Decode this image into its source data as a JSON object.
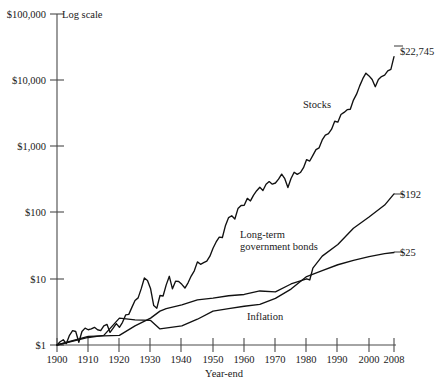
{
  "chart_data": {
    "type": "line",
    "title": "",
    "subtitle": "",
    "xlabel": "Year-end",
    "ylabel": "",
    "scale_note": "Log scale",
    "yscale": "log",
    "ylim": [
      1,
      100000
    ],
    "xlim": [
      1900,
      2008
    ],
    "grid": false,
    "legend_position": "inline-right",
    "ytick_labels": [
      "$100,000",
      "$10,000",
      "$1,000",
      "$100",
      "$10",
      "$1"
    ],
    "ytick_values": [
      100000,
      10000,
      1000,
      100,
      10,
      1
    ],
    "xtick_labels": [
      "1900",
      "1910",
      "1920",
      "1930",
      "1940",
      "1950",
      "1960",
      "1970",
      "1980",
      "1990",
      "2000",
      "2008"
    ],
    "xtick_values": [
      1900,
      1910,
      1920,
      1930,
      1940,
      1950,
      1960,
      1970,
      1980,
      1990,
      2000,
      2008
    ],
    "series": [
      {
        "name": "Stocks",
        "label": "Stocks",
        "end_label": "$22,745",
        "end_value": 22745,
        "color": "#111111",
        "x": [
          1900,
          1901,
          1902,
          1903,
          1904,
          1905,
          1906,
          1907,
          1908,
          1909,
          1910,
          1911,
          1912,
          1913,
          1914,
          1915,
          1916,
          1917,
          1918,
          1919,
          1920,
          1921,
          1922,
          1923,
          1924,
          1925,
          1926,
          1927,
          1928,
          1929,
          1930,
          1931,
          1932,
          1933,
          1934,
          1935,
          1936,
          1937,
          1938,
          1939,
          1940,
          1941,
          1942,
          1943,
          1944,
          1945,
          1946,
          1947,
          1948,
          1949,
          1950,
          1951,
          1952,
          1953,
          1954,
          1955,
          1956,
          1957,
          1958,
          1959,
          1960,
          1961,
          1962,
          1963,
          1964,
          1965,
          1966,
          1967,
          1968,
          1969,
          1970,
          1971,
          1972,
          1973,
          1974,
          1975,
          1976,
          1977,
          1978,
          1979,
          1980,
          1981,
          1982,
          1983,
          1984,
          1985,
          1986,
          1987,
          1988,
          1989,
          1990,
          1991,
          1992,
          1993,
          1994,
          1995,
          1996,
          1997,
          1998,
          1999,
          2000,
          2001,
          2002,
          2003,
          2004,
          2005,
          2006,
          2007,
          2008
        ],
        "values": [
          1.0,
          1.12,
          1.2,
          1.05,
          1.4,
          1.65,
          1.6,
          1.1,
          1.6,
          1.8,
          1.7,
          1.75,
          1.85,
          1.7,
          1.65,
          1.95,
          2.05,
          1.55,
          1.8,
          2.1,
          1.85,
          2.2,
          2.85,
          2.9,
          3.7,
          4.7,
          5.15,
          7.1,
          10.3,
          9.45,
          7.05,
          3.95,
          3.6,
          5.6,
          5.5,
          8.1,
          10.9,
          7.05,
          9.2,
          9.1,
          8.25,
          7.25,
          8.7,
          11.0,
          13.2,
          18.0,
          16.55,
          17.5,
          18.5,
          22.0,
          29.0,
          36.0,
          42.5,
          42.0,
          64.0,
          84.0,
          89.5,
          80.0,
          115.0,
          128.0,
          129.0,
          164.0,
          150.0,
          184.0,
          214.0,
          241.0,
          216.0,
          268.0,
          294.0,
          269.0,
          280.0,
          320.0,
          381.0,
          325.0,
          239.0,
          328.0,
          407.0,
          378.0,
          403.0,
          477.0,
          632.0,
          601.0,
          730.0,
          894.0,
          950.0,
          1252.0,
          1485.0,
          1563.0,
          1822.0,
          2399.0,
          2324.0,
          3031.0,
          3263.0,
          3591.0,
          3639.0,
          5006.0,
          6155.0,
          8208.0,
          10555.0,
          12773.0,
          11609.0,
          10228.0,
          7968.0,
          10252.0,
          11365.0,
          11924.0,
          13806.0,
          14562.0,
          22745.0
        ]
      },
      {
        "name": "Long-term government bonds",
        "label": "Long-term\ngovernment bonds",
        "end_label": "$192",
        "end_value": 192,
        "color": "#111111",
        "x": [
          1900,
          1910,
          1920,
          1925,
          1930,
          1933,
          1935,
          1940,
          1945,
          1950,
          1955,
          1960,
          1965,
          1970,
          1975,
          1980,
          1981,
          1982,
          1985,
          1990,
          1995,
          2000,
          2005,
          2008
        ],
        "values": [
          1.0,
          1.35,
          1.4,
          1.95,
          2.55,
          3.25,
          3.55,
          4.05,
          4.8,
          5.1,
          5.55,
          5.8,
          6.55,
          6.35,
          8.35,
          10.0,
          9.6,
          14.5,
          22.0,
          33.0,
          58.0,
          86.0,
          130.0,
          192.0
        ]
      },
      {
        "name": "Inflation",
        "label": "Inflation",
        "end_label": "$25",
        "end_value": 25,
        "color": "#111111",
        "x": [
          1900,
          1910,
          1915,
          1920,
          1925,
          1930,
          1933,
          1940,
          1945,
          1950,
          1955,
          1960,
          1965,
          1970,
          1975,
          1980,
          1985,
          1990,
          1995,
          2000,
          2005,
          2008
        ],
        "values": [
          1.0,
          1.3,
          1.4,
          2.55,
          2.4,
          2.35,
          1.75,
          1.95,
          2.45,
          3.25,
          3.55,
          3.85,
          4.1,
          5.05,
          7.0,
          10.8,
          13.3,
          16.3,
          19.0,
          21.6,
          24.0,
          25.0
        ]
      }
    ]
  },
  "labels": {
    "log_scale_note": "Log scale",
    "x_axis_title": "Year-end",
    "stocks_label": "Stocks",
    "bonds_label_line1": "Long-term",
    "bonds_label_line2": "government bonds",
    "inflation_label": "Inflation",
    "stocks_end": "$22,745",
    "bonds_end": "$192",
    "inflation_end": "$25",
    "y0": "$100,000",
    "y1": "$10,000",
    "y2": "$1,000",
    "y3": "$100",
    "y4": "$10",
    "y5": "$1",
    "x0": "1900",
    "x1": "1910",
    "x2": "1920",
    "x3": "1930",
    "x4": "1940",
    "x5": "1950",
    "x6": "1960",
    "x7": "1970",
    "x8": "1980",
    "x9": "1990",
    "x10": "2000",
    "x11": "2008"
  },
  "colors": {
    "line": "#111111",
    "axis": "#4a4a4a",
    "background": "#ffffff",
    "text": "#1a1a1a"
  }
}
